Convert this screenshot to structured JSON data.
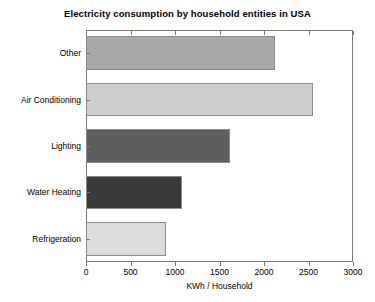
{
  "chart_data": {
    "type": "bar",
    "orientation": "horizontal",
    "title": "Electricity consumption by household entities in USA",
    "xlabel": "KWh / Household",
    "ylabel": "",
    "categories": [
      "Refrigeration",
      "Water Heating",
      "Lighting",
      "Air Conditioning",
      "Other"
    ],
    "values": [
      900,
      1080,
      1620,
      2550,
      2120
    ],
    "xlim": [
      0,
      3000
    ],
    "xticks": [
      0,
      500,
      1000,
      1500,
      2000,
      2500,
      3000
    ],
    "xtick_labels": [
      "0",
      "500",
      "1000",
      "1500",
      "2000",
      "2500",
      "3000"
    ],
    "grid": false,
    "legend": "none",
    "bar_colors": [
      "#dcdcdc",
      "#3a3a3a",
      "#5e5e5e",
      "#cdcdcd",
      "#a8a8a8"
    ],
    "bar_edge_color": "#8a8a8a",
    "axis_color": "#7a7a7a",
    "background": "#ffffff"
  }
}
